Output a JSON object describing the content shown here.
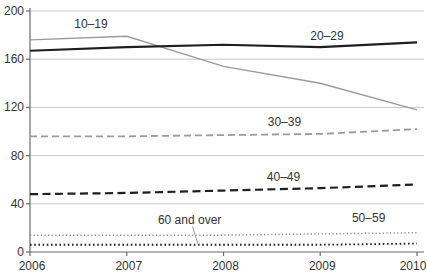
{
  "chart_data": {
    "type": "line",
    "title": "",
    "xlabel": "",
    "ylabel": "",
    "x": [
      2006,
      2007,
      2008,
      2009,
      2010
    ],
    "x_tick_labels": [
      "2006",
      "2007",
      "2008",
      "2009",
      "2010"
    ],
    "ylim": [
      0,
      200
    ],
    "y_ticks": [
      0,
      40,
      80,
      120,
      160,
      200
    ],
    "y_tick_labels": [
      "0",
      "40",
      "80",
      "120",
      "160",
      "200"
    ],
    "grid": "horizontal",
    "legend": "inline-labels",
    "colors": {
      "gray_series": "#9b9b9b",
      "black_series": "#1f1f1f",
      "gridline": "#c9c9c9",
      "axis": "#6b6b6b",
      "label_text": "#333333"
    },
    "series": [
      {
        "name": "10–19",
        "values": [
          176,
          179,
          154,
          140,
          118
        ],
        "color": "#9b9b9b",
        "style": "solid",
        "width": 1.4,
        "dash": ""
      },
      {
        "name": "20–29",
        "values": [
          167,
          170,
          172,
          170,
          174
        ],
        "color": "#1f1f1f",
        "style": "solid",
        "width": 2.2,
        "dash": ""
      },
      {
        "name": "30–39",
        "values": [
          96,
          96,
          97,
          98,
          102
        ],
        "color": "#9b9b9b",
        "style": "dashed",
        "width": 1.8,
        "dash": "7 4"
      },
      {
        "name": "40–49",
        "values": [
          48,
          49,
          51,
          53,
          56
        ],
        "color": "#1f1f1f",
        "style": "dashed",
        "width": 2.2,
        "dash": "8 4.5"
      },
      {
        "name": "50–59",
        "values": [
          14,
          14,
          14,
          15,
          16
        ],
        "color": "#8c8c8c",
        "style": "dotted",
        "width": 1.5,
        "dash": "1.2 2.4"
      },
      {
        "name": "60 and over",
        "values": [
          6,
          6,
          6,
          6,
          7
        ],
        "color": "#1f1f1f",
        "style": "dotted",
        "width": 1.8,
        "dash": "1.6 2.6"
      }
    ],
    "annotations": [
      {
        "text": "10–19",
        "x": 2006.63,
        "y": 189
      },
      {
        "text": "20–29",
        "x": 2009.07,
        "y": 179.5
      },
      {
        "text": "30–39",
        "x": 2008.63,
        "y": 108
      },
      {
        "text": "40–49",
        "x": 2008.62,
        "y": 62
      },
      {
        "text": "50–59",
        "x": 2009.5,
        "y": 28.5
      },
      {
        "text": "60 and over",
        "x": 2007.65,
        "y": 26.5
      }
    ],
    "leader_line": {
      "x1": 2007.68,
      "y1": 21,
      "x2": 2007.74,
      "y2": 5.5
    }
  }
}
